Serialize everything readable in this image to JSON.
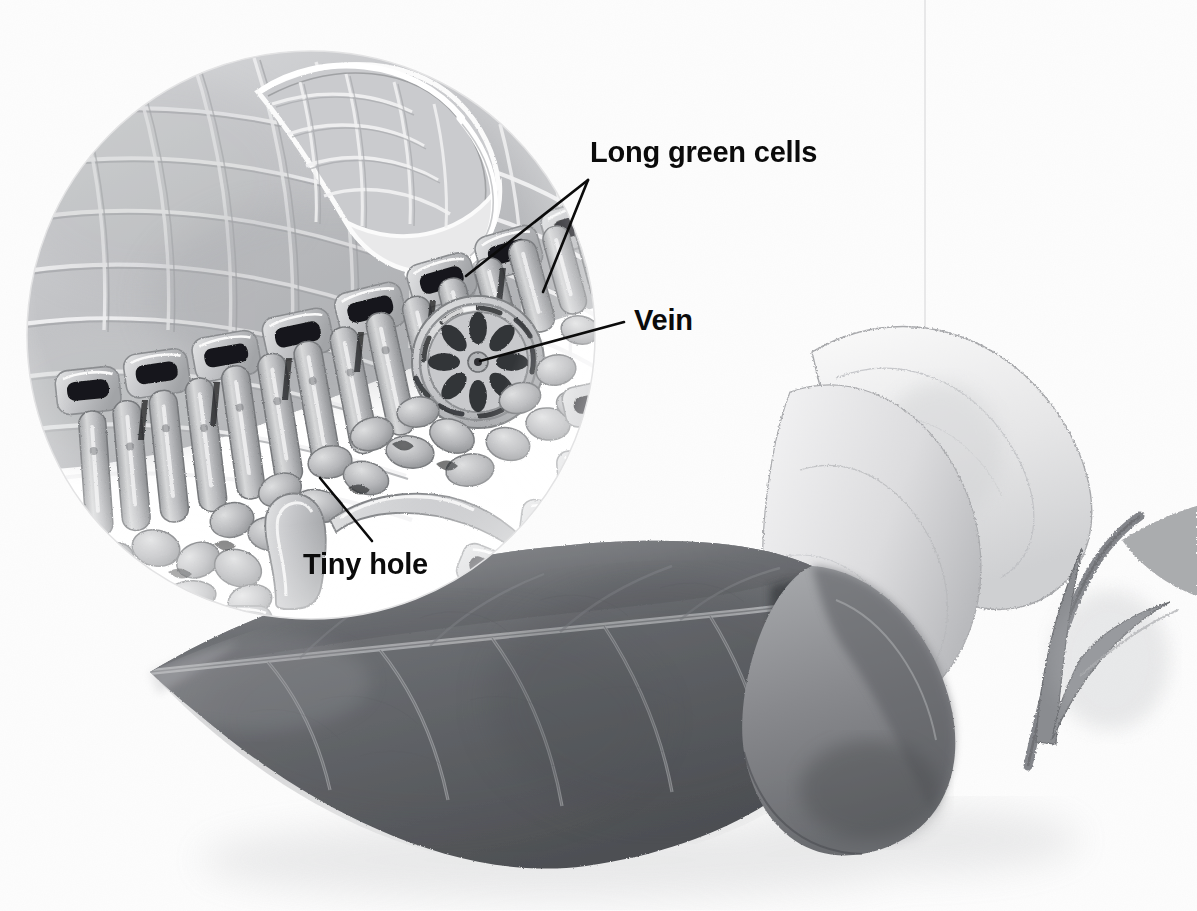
{
  "illustration": {
    "title": "Leaf structure with magnified cross-section",
    "medium": "graphite pencil drawing",
    "background_color": "#fdfdfd",
    "label_color": "#0b0b0b"
  },
  "labels": [
    {
      "id": "long-green-cells",
      "text": "Long green cells",
      "x": 590,
      "y": 136,
      "font_size": 29,
      "leaders": [
        {
          "x1": 588,
          "y1": 180,
          "x2": 466,
          "y2": 276
        },
        {
          "x1": 588,
          "y1": 180,
          "x2": 543,
          "y2": 292
        }
      ]
    },
    {
      "id": "vein",
      "text": "Vein",
      "x": 634,
      "y": 304,
      "font_size": 29,
      "leaders": [
        {
          "x1": 624,
          "y1": 322,
          "x2": 480,
          "y2": 361
        }
      ]
    },
    {
      "id": "tiny-hole",
      "text": "Tiny hole",
      "x": 303,
      "y": 548,
      "font_size": 29,
      "leaders": [
        {
          "x1": 372,
          "y1": 541,
          "x2": 320,
          "y2": 478
        }
      ]
    }
  ],
  "magnifier": {
    "name": "magnified-cross-section",
    "center_x": 311,
    "center_y": 335,
    "radius": 284,
    "contents": [
      "upper epidermis surface with diamond lattice cell pattern",
      "curled flap of upper epidermis",
      "upper epidermis cells in cross-section",
      "palisade (long green) cells",
      "vascular bundle (vein)",
      "spongy mesophyll cells",
      "lower epidermis with stoma (tiny hole)"
    ]
  },
  "leaf": {
    "name": "main-leaf",
    "description": "large dark leaf, tip pointing left, blade curled back at right revealing pale underside",
    "features": [
      "midrib",
      "secondary veins",
      "curled margin",
      "cast shadow"
    ]
  },
  "stem": {
    "name": "stem-with-bracts",
    "description": "stem at right with two small narrow leaves"
  },
  "palette": {
    "paper": "#fdfdfd",
    "leaf_dark": "#6f7175",
    "leaf_darkest": "#3f4145",
    "leaf_pale": "#dcdcdd",
    "pencil_mid": "#9a9c9f",
    "pencil_light": "#c9cacc",
    "outline": "#111111"
  }
}
